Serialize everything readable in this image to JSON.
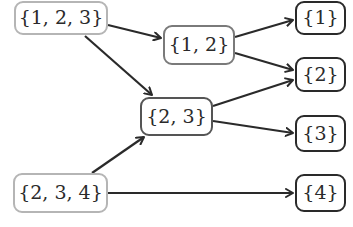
{
  "diagram": {
    "type": "directed-graph",
    "nodes": [
      {
        "id": "n123",
        "label": "{1, 2, 3}",
        "x": 14,
        "y": 1,
        "w": 94,
        "h": 34,
        "stroke": "#b5b5b5"
      },
      {
        "id": "n12",
        "label": "{1, 2}",
        "x": 163,
        "y": 25,
        "w": 72,
        "h": 40,
        "stroke": "#7a7a7a"
      },
      {
        "id": "n23",
        "label": "{2, 3}",
        "x": 140,
        "y": 97,
        "w": 73,
        "h": 39,
        "stroke": "#555555"
      },
      {
        "id": "n234",
        "label": "{2, 3, 4}",
        "x": 13,
        "y": 173,
        "w": 95,
        "h": 40,
        "stroke": "#b5b5b5"
      },
      {
        "id": "n1",
        "label": "{1}",
        "x": 295,
        "y": 1,
        "w": 51,
        "h": 34,
        "stroke": "#2a2a2a"
      },
      {
        "id": "n2",
        "label": "{2}",
        "x": 295,
        "y": 57,
        "w": 51,
        "h": 35,
        "stroke": "#2a2a2a"
      },
      {
        "id": "n3",
        "label": "{3}",
        "x": 295,
        "y": 115,
        "w": 51,
        "h": 37,
        "stroke": "#2a2a2a"
      },
      {
        "id": "n4",
        "label": "{4}",
        "x": 295,
        "y": 174,
        "w": 51,
        "h": 38,
        "stroke": "#2a2a2a"
      }
    ],
    "edges": [
      {
        "from": "{1, 2, 3}",
        "to": "{1, 2}",
        "x1": 108,
        "y1": 25,
        "x2": 161,
        "y2": 38
      },
      {
        "from": "{1, 2, 3}",
        "to": "{2, 3}",
        "x1": 85,
        "y1": 36,
        "x2": 152,
        "y2": 95
      },
      {
        "from": "{1, 2}",
        "to": "{1}",
        "x1": 235,
        "y1": 37,
        "x2": 293,
        "y2": 20
      },
      {
        "from": "{1, 2}",
        "to": "{2}",
        "x1": 235,
        "y1": 53,
        "x2": 293,
        "y2": 70
      },
      {
        "from": "{2, 3}",
        "to": "{2}",
        "x1": 213,
        "y1": 106,
        "x2": 293,
        "y2": 80
      },
      {
        "from": "{2, 3}",
        "to": "{3}",
        "x1": 213,
        "y1": 121,
        "x2": 293,
        "y2": 133
      },
      {
        "from": "{2, 3, 4}",
        "to": "{2, 3}",
        "x1": 92,
        "y1": 173,
        "x2": 144,
        "y2": 137
      },
      {
        "from": "{2, 3, 4}",
        "to": "{4}",
        "x1": 108,
        "y1": 193,
        "x2": 293,
        "y2": 193
      }
    ],
    "edge_color": "#2a2a2a"
  }
}
